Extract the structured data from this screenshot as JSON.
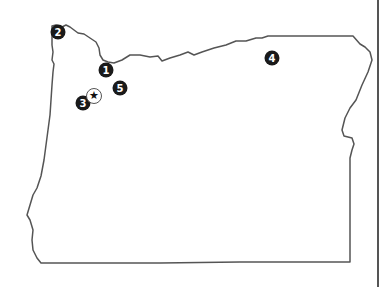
{
  "map": {
    "region": "Oregon",
    "outline_color": "#555555",
    "marker_color": "#1a1a1a",
    "markers": [
      {
        "label": "1",
        "x": 106,
        "y": 70
      },
      {
        "label": "2",
        "x": 58,
        "y": 32
      },
      {
        "label": "3",
        "x": 83,
        "y": 103
      },
      {
        "label": "4",
        "x": 272,
        "y": 58
      },
      {
        "label": "5",
        "x": 120,
        "y": 88
      }
    ],
    "star": {
      "icon": "★",
      "x": 94,
      "y": 96
    }
  }
}
